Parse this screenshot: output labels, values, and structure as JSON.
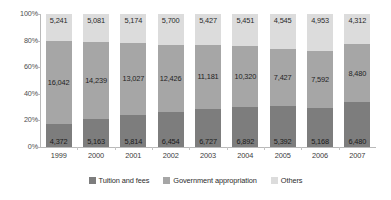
{
  "chart_data": {
    "type": "bar",
    "stacked": true,
    "normalized": true,
    "title": "",
    "xlabel": "",
    "ylabel": "",
    "ylim": [
      0,
      100
    ],
    "ytick_labels": [
      "100%",
      "80%",
      "60%",
      "40%",
      "20%",
      "0%"
    ],
    "ytick_values": [
      100,
      80,
      60,
      40,
      20,
      0
    ],
    "grid": false,
    "legend_position": "bottom",
    "categories": [
      "1999",
      "2000",
      "2001",
      "2002",
      "2003",
      "2004",
      "2005",
      "2006",
      "2007"
    ],
    "series": [
      {
        "name": "Tuition and fees",
        "color": "#7d7d7d",
        "values": [
          4372,
          5163,
          5814,
          6454,
          6727,
          6892,
          5392,
          5168,
          6480
        ],
        "labels": [
          "4,372",
          "5,163",
          "5,814",
          "6,454",
          "6,727",
          "6,892",
          "5,392",
          "5,168",
          "6,480"
        ],
        "percents": [
          17.0,
          21.0,
          24.2,
          26.3,
          28.8,
          30.4,
          31.1,
          29.2,
          33.6
        ]
      },
      {
        "name": "Government appropriation",
        "color": "#a6a6a6",
        "values": [
          16042,
          14239,
          13027,
          12426,
          11181,
          10320,
          7427,
          7592,
          8480
        ],
        "labels": [
          "16,042",
          "14,239",
          "13,027",
          "12,426",
          "11,181",
          "10,320",
          "7,427",
          "7,592",
          "8,480"
        ],
        "percents": [
          62.6,
          57.9,
          54.3,
          50.5,
          47.9,
          45.5,
          42.7,
          42.8,
          44.0
        ]
      },
      {
        "name": "Others",
        "color": "#dcdcdc",
        "values": [
          5241,
          5081,
          5174,
          5700,
          5427,
          5451,
          4545,
          4953,
          4312
        ],
        "labels": [
          "5,241",
          "5,081",
          "5,174",
          "5,700",
          "5,427",
          "5,451",
          "4,545",
          "4,953",
          "4,312"
        ],
        "percents": [
          20.4,
          21.1,
          21.5,
          23.2,
          23.3,
          24.1,
          26.2,
          28.0,
          22.4
        ]
      }
    ]
  },
  "legend": {
    "items": [
      {
        "label": "Tuition and fees",
        "color": "#7d7d7d"
      },
      {
        "label": "Government appropriation",
        "color": "#a6a6a6"
      },
      {
        "label": "Others",
        "color": "#dcdcdc"
      }
    ]
  }
}
